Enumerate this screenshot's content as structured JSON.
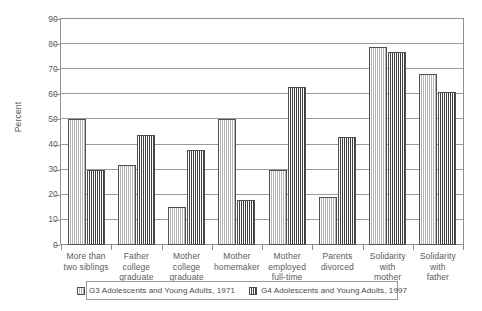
{
  "chart_data": {
    "type": "bar",
    "title": "",
    "xlabel": "",
    "ylabel": "Percent",
    "ylim": [
      0,
      90
    ],
    "yticks": [
      0,
      10,
      20,
      30,
      40,
      50,
      60,
      70,
      80,
      90
    ],
    "ytick_labels": [
      "0",
      "10",
      "20",
      "30",
      "40",
      "50",
      "60",
      "70",
      "80",
      "90"
    ],
    "grid": true,
    "legend_position": "bottom",
    "categories": [
      "More than\ntwo siblings",
      "Father\ncollege\ngraduate",
      "Mother\ncollege\ngraduate",
      "Mother\nhomemaker",
      "Mother\nemployed\nfull-time",
      "Parents\ndivorced",
      "Solidarity\nwith\nmother",
      "Solidarity\nwith\nfather"
    ],
    "category_lines": [
      [
        "More than",
        "two siblings"
      ],
      [
        "Father",
        "college",
        "graduate"
      ],
      [
        "Mother",
        "college",
        "graduate"
      ],
      [
        "Mother",
        "homemaker"
      ],
      [
        "Mother",
        "employed",
        "full-time"
      ],
      [
        "Parents",
        "divorced"
      ],
      [
        "Solidarity",
        "with",
        "mother"
      ],
      [
        "Solidarity",
        "with",
        "father"
      ]
    ],
    "series": [
      {
        "name": "G3 Adolescents and Young Adults, 1971",
        "key": "g3",
        "pattern": "vertical-lines-light",
        "color": "#b4b4b4",
        "values": [
          50,
          32,
          15,
          50,
          30,
          19,
          79,
          68
        ]
      },
      {
        "name": "G4 Adolescents and Young Adults, 1997",
        "key": "g4",
        "pattern": "cross-hatch-dark",
        "color": "#3f3f3f",
        "values": [
          30,
          44,
          38,
          18,
          63,
          43,
          77,
          61
        ]
      }
    ]
  },
  "axis": {
    "y_title": "Percent"
  },
  "legend": {
    "entries": [
      {
        "label": "G3 Adolescents and Young Adults, 1971",
        "key": "g3"
      },
      {
        "label": "G4 Adolescents and Young Adults, 1997",
        "key": "g4"
      }
    ]
  }
}
